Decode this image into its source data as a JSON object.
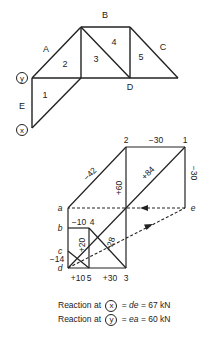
{
  "truss": {
    "region_labels": {
      "A": "A",
      "B": "B",
      "C": "C",
      "D": "D",
      "E": "E",
      "r1": "1",
      "r2": "2",
      "r3": "3",
      "r4": "4",
      "r5": "5"
    },
    "supports": {
      "x": "x",
      "y": "y"
    }
  },
  "force_diagram": {
    "point_labels": {
      "p1": "1",
      "p2": "2",
      "p3": "3",
      "p4": "4",
      "p5": "5",
      "a": "a",
      "b": "b",
      "c": "c",
      "d": "d",
      "e": "e"
    },
    "member_forces": {
      "m2_1": "−30",
      "m1_e": "−30",
      "ma_2": "−42",
      "m2_3": "+60",
      "md_1": "+84",
      "mb_4": "−10",
      "m4_5": "+20",
      "m3_4": "−28",
      "mc_d": "−14",
      "md_5": "+10",
      "m5_3": "+30"
    }
  },
  "caption": {
    "line1": {
      "prefix": "Reaction at",
      "symbol": "x",
      "eq": "= ",
      "italic": "de",
      "suffix": " = 67 kN"
    },
    "line2": {
      "prefix": "Reaction at",
      "symbol": "y",
      "eq": "= ",
      "italic": "ea",
      "suffix": " = 60 kN"
    }
  },
  "colors": {
    "line": "#222222",
    "background": "#ffffff"
  }
}
